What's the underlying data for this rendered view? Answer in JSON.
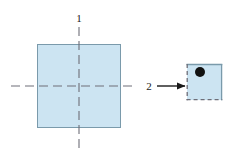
{
  "figure": {
    "background_color": "#ffffff",
    "width": 240,
    "height": 153
  },
  "colors": {
    "shape_fill": "#cce4f2",
    "shape_stroke": "#7a9aab",
    "centerline": "#6e6e78",
    "arrow": "#1a1a1a",
    "dot": "#111111",
    "label": "#1a1a1a"
  },
  "labels": [
    {
      "id": "label-1",
      "text": "1",
      "x": 79,
      "y": 22,
      "anchor": "middle",
      "describes": "vertical-centerline"
    },
    {
      "id": "label-2",
      "text": "2",
      "x": 149,
      "y": 89,
      "anchor": "middle",
      "describes": "transformation-arrow"
    }
  ],
  "shapes": {
    "large_square": {
      "name": "large-square",
      "x": 37,
      "y": 44,
      "width": 84,
      "height": 84,
      "fill": "#cce4f2",
      "stroke": "#7a9aab",
      "stroke_width": 1,
      "border_style": "solid"
    },
    "small_square": {
      "name": "small-square",
      "x": 187,
      "y": 64,
      "width": 35,
      "height": 36,
      "fill": "#cce4f2",
      "stroke": "#7a9aab",
      "stroke_width": 1.3,
      "solid_edges": [
        "top",
        "right"
      ],
      "dashed_edges": [
        "left",
        "bottom"
      ],
      "dash_pattern": "4,3"
    },
    "dot": {
      "name": "dot-marker",
      "cx": 200,
      "cy": 72,
      "r": 5,
      "fill": "#111111"
    }
  },
  "centerlines": {
    "vertical": {
      "name": "vertical-centerline",
      "x": 79,
      "y1": 27,
      "y2": 151,
      "stroke": "#6e6e78",
      "dash_pattern": "9,5"
    },
    "horizontal": {
      "name": "horizontal-centerline",
      "y": 86,
      "x1": 11,
      "x2": 137,
      "stroke": "#6e6e78",
      "dash_pattern": "9,5"
    }
  },
  "arrow": {
    "name": "transformation-arrow",
    "x1": 157,
    "x2": 186,
    "y": 86,
    "stroke": "#1a1a1a",
    "stroke_width": 1.4,
    "head_length": 8,
    "head_width": 7,
    "direction": "right"
  }
}
